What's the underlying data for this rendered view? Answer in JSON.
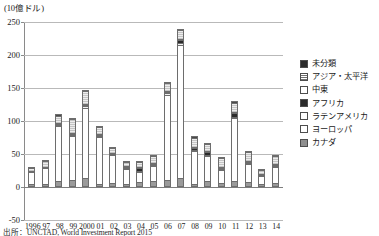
{
  "chart_data": {
    "type": "bar",
    "stacked": true,
    "title": "",
    "subtitle": "",
    "unit_label": "(10億ドル)",
    "xlabel": "",
    "ylabel": "",
    "ylim": [
      -50,
      250
    ],
    "yticks": [
      -50,
      0,
      50,
      100,
      150,
      200,
      250
    ],
    "ytick_labels": [
      "-50",
      "0",
      "50",
      "100",
      "150",
      "200",
      "250"
    ],
    "grid": true,
    "legend_position": "right",
    "categories": [
      "1996",
      "97",
      "98",
      "99",
      "2000",
      "01",
      "02",
      "03",
      "04",
      "05",
      "06",
      "07",
      "08",
      "09",
      "10",
      "11",
      "12",
      "13",
      "14"
    ],
    "series": [
      {
        "name": "カナダ",
        "color": "#9a9a9a",
        "swatch": "filled-gray",
        "values": [
          5,
          4,
          9,
          11,
          14,
          5,
          6,
          5,
          8,
          10,
          11,
          14,
          4,
          9,
          6,
          9,
          7,
          4,
          7
        ]
      },
      {
        "name": "ヨーロッパ",
        "color": "#ffffff",
        "swatch": "open",
        "values": [
          18,
          26,
          84,
          67,
          107,
          72,
          44,
          24,
          15,
          23,
          130,
          201,
          51,
          38,
          21,
          96,
          29,
          14,
          24
        ]
      },
      {
        "name": "ラテンアメリカ",
        "color": "#f2f2f2",
        "swatch": "open",
        "values": [
          1,
          1,
          2,
          2,
          2,
          1,
          1,
          1,
          1,
          2,
          2,
          3,
          1,
          2,
          2,
          2,
          2,
          1,
          2
        ]
      },
      {
        "name": "アフリカ",
        "color": "#2b2b2b",
        "swatch": "filled-dark",
        "values": [
          0,
          0,
          1,
          1,
          1,
          1,
          0,
          1,
          6,
          1,
          1,
          5,
          4,
          5,
          1,
          6,
          1,
          0,
          1
        ]
      },
      {
        "name": "中東",
        "color": "#ffffff",
        "swatch": "open",
        "values": [
          0,
          0,
          1,
          1,
          1,
          1,
          1,
          1,
          1,
          1,
          1,
          1,
          1,
          1,
          1,
          1,
          1,
          1,
          1
        ]
      },
      {
        "name": "アジア・太平洋",
        "color": "#cfcfcf",
        "swatch": "hatched",
        "values": [
          5,
          9,
          11,
          21,
          20,
          12,
          8,
          6,
          8,
          10,
          12,
          14,
          13,
          10,
          13,
          14,
          13,
          7,
          13
        ]
      },
      {
        "name": "未分類",
        "color": "#4a4a4a",
        "swatch": "filled-dark",
        "values": [
          1,
          1,
          2,
          2,
          2,
          1,
          1,
          1,
          1,
          1,
          2,
          2,
          3,
          2,
          1,
          2,
          1,
          1,
          1
        ]
      }
    ],
    "totals": [
      30,
      41,
      110,
      105,
      147,
      93,
      61,
      39,
      40,
      48,
      159,
      240,
      77,
      67,
      45,
      130,
      54,
      28,
      49
    ]
  },
  "legend": {
    "items": [
      {
        "label": "未分類",
        "swatch": "filled-dark"
      },
      {
        "label": "アジア・太平洋",
        "swatch": "hatched"
      },
      {
        "label": "中東",
        "swatch": "open"
      },
      {
        "label": "アフリカ",
        "swatch": "filled-dark"
      },
      {
        "label": "ラテンアメリカ",
        "swatch": "open"
      },
      {
        "label": "ヨーロッパ",
        "swatch": "open"
      },
      {
        "label": "カナダ",
        "swatch": "filled-gray"
      }
    ]
  },
  "source": {
    "text": "出所：UNCTAD, World Investment Report 2015"
  },
  "colors": {
    "gridline": "#b9b9b9",
    "axis": "#8a8a8a",
    "bar_border": "#6d6d6d",
    "text": "#1a1a1a"
  }
}
